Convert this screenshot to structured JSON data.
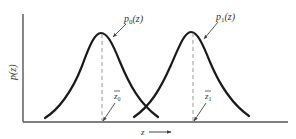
{
  "figure": {
    "type": "two-gaussian-distributions",
    "axes": {
      "y_label": "p(z)",
      "x_label": "z",
      "x_arrow": "right-arrow"
    },
    "curves": [
      {
        "id": "p0",
        "label_base": "p",
        "label_sub": "0",
        "label_arg": "(z)",
        "mean_label_base": "z",
        "mean_label_sub": "0",
        "mean_marker": "dashed-vertical-line"
      },
      {
        "id": "p1",
        "label_base": "p",
        "label_sub": "1",
        "label_arg": "(z)",
        "mean_label_base": "z",
        "mean_label_sub": "1",
        "mean_marker": "dashed-vertical-line"
      }
    ],
    "colors": {
      "curve": "#1a1a1a",
      "axis": "#555555",
      "dashed": "#999999",
      "text": "#333333"
    }
  }
}
